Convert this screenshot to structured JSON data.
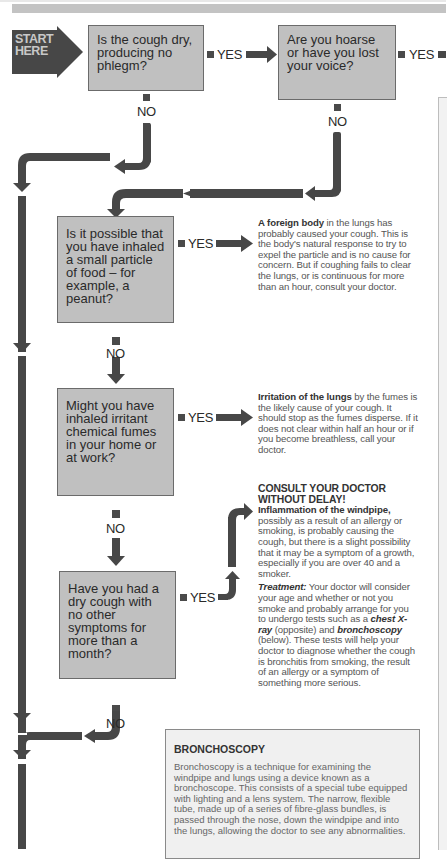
{
  "start": {
    "label_line1": "START",
    "label_line2": "HERE"
  },
  "questions": [
    {
      "id": "q1",
      "text": "Is the cough dry, producing no phlegm?"
    },
    {
      "id": "q2",
      "text": "Are you hoarse or have you lost your voice?"
    },
    {
      "id": "q3",
      "text": "Is it possible that you have inhaled a small particle of food – for example, a peanut?"
    },
    {
      "id": "q4",
      "text": "Might you have inhaled irritant chemical fumes in your home or at work?"
    },
    {
      "id": "q5",
      "text": "Have you had a dry cough with no other symptoms for more than a month?"
    }
  ],
  "labels": {
    "yes": "YES",
    "no": "NO"
  },
  "answers": {
    "foreign_body": {
      "bold": "A foreign body",
      "text": " in the lungs has probably caused your cough. This is the body's natural response to try to expel the particle and is no cause for concern. But if coughing fails to clear the lungs, or is continuous for more than an hour, consult your doctor."
    },
    "irritation": {
      "bold": "Irritation of the lungs",
      "text": " by the fumes is the likely cause of your cough. It should stop as the fumes disperse. If it does not clear within half an hour or if you become breathless, call your doctor."
    },
    "windpipe": {
      "heading": "CONSULT YOUR DOCTOR WITHOUT DELAY!",
      "bold": "Inflammation of the windpipe,",
      "text": " possibly as a result of an allergy or smoking, is probably causing the cough, but there is a slight possibility that it may be a symptom of a growth, especially if you are over 40 and a smoker.",
      "treatment_label": "Treatment:",
      "treatment_1": " Your doctor will consider your age and whether or not you smoke and probably arrange for you to undergo tests such as a ",
      "treatment_em1": "chest X-ray",
      "treatment_2": " (opposite) and ",
      "treatment_em2": "bronchoscopy",
      "treatment_3": " (below). These tests will help your doctor to diagnose whether the cough is bronchitis from smoking, the result of an allergy or a symptom of something more serious."
    }
  },
  "bronchoscopy": {
    "title": "BRONCHOSCOPY",
    "text": "Bronchoscopy is a technique for examining the windpipe and lungs using a device known as a bronchoscope. This consists of a special tube equipped with lighting and a lens system. The narrow, flexible tube, made up of a series of fibre-glass bundles, is passed through the nose, down the windpipe and into the lungs, allowing the doctor to see any abnormalities."
  },
  "colors": {
    "arrow": "#474747",
    "box_fill": "#c0c0c0",
    "box_border": "#6b6b6b",
    "start_fill": "#4a4a4a",
    "header_bar": "#c3c3c3"
  }
}
